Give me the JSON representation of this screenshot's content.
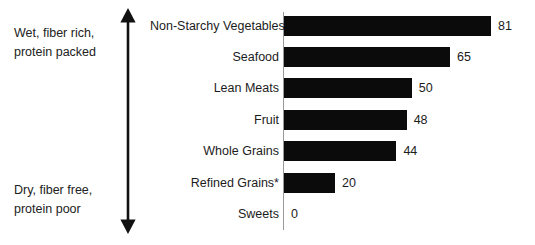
{
  "annotations": {
    "top_note": "Wet, fiber rich,\nprotein packed",
    "bottom_note": "Dry, fiber free,\nprotein poor",
    "arrow_name": "double-headed-vertical-arrow"
  },
  "chart_data": {
    "type": "bar",
    "orientation": "horizontal",
    "title": "",
    "xlabel": "",
    "ylabel": "",
    "categories": [
      "Non-Starchy Vegetables",
      "Seafood",
      "Lean Meats",
      "Fruit",
      "Whole Grains",
      "Refined Grains*",
      "Sweets"
    ],
    "values": [
      81,
      65,
      50,
      48,
      44,
      20,
      0
    ],
    "value_labels": [
      "81",
      "65",
      "50",
      "48",
      "44",
      "20",
      "0"
    ],
    "xlim": [
      0,
      81
    ],
    "grid": false,
    "legend": false,
    "bar_color": "#0b0b0b",
    "axis_color": "#9a9a9a",
    "background": "#ffffff"
  }
}
